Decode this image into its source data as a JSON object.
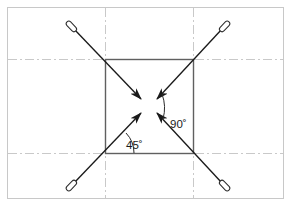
{
  "figure": {
    "title": "",
    "type": "technical-line-drawing",
    "canvas": {
      "width": 291,
      "height": 206,
      "background": "#ffffff"
    },
    "frame": {
      "name": "outer-border",
      "x": 7,
      "y": 7,
      "width": 277,
      "height": 192,
      "stroke": "#c8c8c8",
      "stroke_width": 1
    },
    "center_lines": {
      "style": "dash-dot",
      "stroke": "#c9c9c9",
      "stroke_width": 1,
      "vertical_x": [
        105,
        193
      ],
      "horizontal_y": [
        59,
        153
      ]
    },
    "square": {
      "name": "center-square",
      "x": 105,
      "y": 59,
      "width": 88,
      "height": 94,
      "stroke": "#555555",
      "stroke_width": 1.4,
      "fill": "none"
    },
    "center_point": {
      "x": 149,
      "y": 106
    },
    "arrows": [
      {
        "name": "arrow-from-top-left",
        "tail": {
          "x": 72,
          "y": 27
        },
        "head": {
          "x": 141,
          "y": 99
        },
        "direction": "down-right",
        "origin_corner": "top-left",
        "tail_cap": "capsule"
      },
      {
        "name": "arrow-from-top-right",
        "tail": {
          "x": 224,
          "y": 27
        },
        "head": {
          "x": 157,
          "y": 99
        },
        "direction": "down-left",
        "origin_corner": "top-right",
        "tail_cap": "capsule"
      },
      {
        "name": "arrow-from-bottom-left",
        "tail": {
          "x": 72,
          "y": 185
        },
        "head": {
          "x": 141,
          "y": 113
        },
        "direction": "up-right",
        "origin_corner": "bottom-left",
        "tail_cap": "capsule"
      },
      {
        "name": "arrow-from-bottom-right",
        "tail": {
          "x": 224,
          "y": 185
        },
        "head": {
          "x": 157,
          "y": 113
        },
        "direction": "up-left",
        "origin_corner": "bottom-right",
        "tail_cap": "capsule"
      }
    ],
    "angle_dimensions": [
      {
        "name": "angle-45",
        "label": "45˚",
        "value": 45,
        "unit": "degrees",
        "label_x": 127,
        "label_y": 148,
        "vertex": {
          "x": 105,
          "y": 153
        },
        "arc_radius": 28,
        "from_deg": 0,
        "to_deg": 45
      },
      {
        "name": "angle-90",
        "label": "90˚",
        "value": 90,
        "unit": "degrees",
        "label_x": 176,
        "label_y": 127,
        "vertex": {
          "x": 149,
          "y": 106
        },
        "arc_radius": 36,
        "from_deg": -45,
        "to_deg": 45
      }
    ],
    "colors": {
      "line": "#555555",
      "arrow": "#1a1a1a",
      "centerline": "#c9c9c9",
      "frame": "#c8c8c8",
      "text": "#1a1a1a"
    }
  }
}
